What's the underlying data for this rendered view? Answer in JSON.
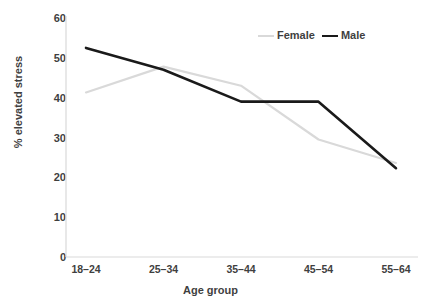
{
  "chart_data": {
    "type": "line",
    "title": "",
    "subtitle": "",
    "xlabel": "Age group",
    "ylabel": "% elevated stress",
    "categories": [
      "18–24",
      "25–34",
      "35–44",
      "45–54",
      "55–64"
    ],
    "series": [
      {
        "name": "Female",
        "color": "#d9d9d9",
        "values": [
          41.3,
          47.8,
          43.0,
          29.5,
          23.6
        ]
      },
      {
        "name": "Male",
        "color": "#1a1a1a",
        "values": [
          52.5,
          47.0,
          39.0,
          39.0,
          22.3
        ]
      }
    ],
    "ylim": [
      0,
      60
    ],
    "yticks": [
      0,
      10,
      20,
      30,
      40,
      50,
      60
    ],
    "ytick_labels": [
      "0",
      "10",
      "20",
      "30",
      "40",
      "50",
      "60"
    ],
    "grid": false,
    "legend_position": "top-right",
    "annotations": []
  },
  "axis": {
    "y_title": "% elevated stress",
    "x_title": "Age group"
  },
  "legend": {
    "entries": [
      {
        "label": "Female",
        "color": "#d9d9d9"
      },
      {
        "label": "Male",
        "color": "#1a1a1a"
      }
    ]
  },
  "colors": {
    "background": "#ffffff",
    "axis_line": "#d9d9d9",
    "text": "#3f3f3f",
    "female_series": "#d9d9d9",
    "male_series": "#1a1a1a"
  }
}
